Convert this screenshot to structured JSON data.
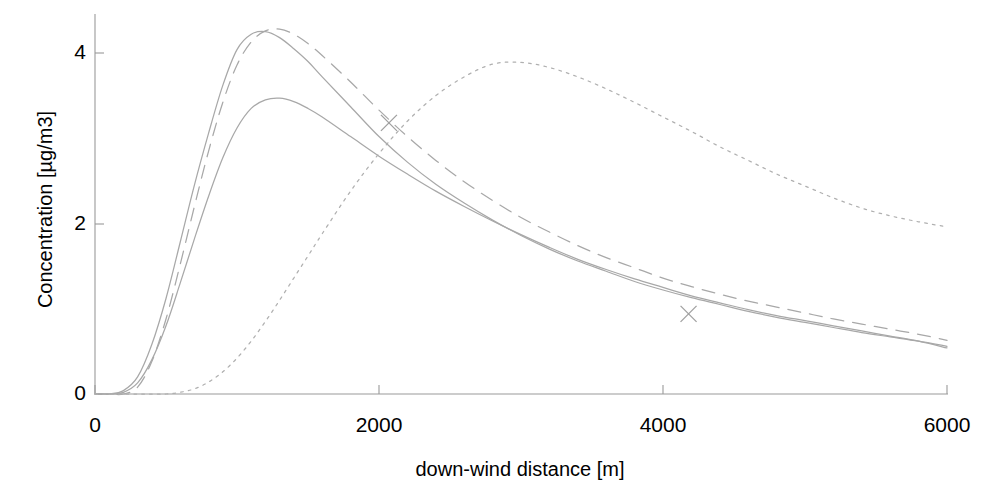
{
  "chart_data": {
    "type": "line",
    "title": "",
    "subtitle": "",
    "xlabel": "down-wind distance [m]",
    "ylabel": "Concentration [µg/m3]",
    "xlim": [
      0,
      6000
    ],
    "ylim": [
      0,
      4.6
    ],
    "xticks": [
      0,
      2000,
      4000,
      6000
    ],
    "xtick_labels": [
      "0",
      "2000",
      "4000",
      "6000"
    ],
    "yticks": [
      0,
      2,
      4
    ],
    "ytick_labels": [
      "0",
      "2",
      "4"
    ],
    "grid": false,
    "legend": "none",
    "x": [
      0,
      100,
      200,
      300,
      400,
      500,
      600,
      700,
      800,
      900,
      1000,
      1100,
      1200,
      1300,
      1400,
      1500,
      1600,
      1800,
      2000,
      2200,
      2400,
      2600,
      2800,
      3000,
      3200,
      3400,
      3600,
      3800,
      4000,
      4200,
      4400,
      4600,
      4800,
      5000,
      5200,
      5400,
      5600,
      5800,
      6000
    ],
    "series": [
      {
        "name": "solid-upper",
        "style": "solid",
        "color": "#a8a8a8",
        "peak_x": 1050,
        "peak_y": 4.27,
        "values": [
          0.0,
          0.0,
          0.04,
          0.2,
          0.58,
          1.12,
          1.78,
          2.45,
          3.06,
          3.62,
          4.04,
          4.22,
          4.25,
          4.18,
          4.05,
          3.9,
          3.72,
          3.37,
          3.02,
          2.72,
          2.46,
          2.24,
          2.04,
          1.86,
          1.7,
          1.56,
          1.44,
          1.32,
          1.22,
          1.13,
          1.05,
          0.97,
          0.9,
          0.84,
          0.78,
          0.72,
          0.67,
          0.62,
          0.56
        ]
      },
      {
        "name": "dashed",
        "style": "dashed",
        "color": "#a8a8a8",
        "peak_x": 1200,
        "peak_y": 4.28,
        "values": [
          0.0,
          0.0,
          0.0,
          0.08,
          0.38,
          0.88,
          1.52,
          2.2,
          2.85,
          3.42,
          3.86,
          4.13,
          4.26,
          4.28,
          4.22,
          4.11,
          3.97,
          3.66,
          3.33,
          3.02,
          2.74,
          2.49,
          2.27,
          2.07,
          1.9,
          1.74,
          1.6,
          1.48,
          1.36,
          1.26,
          1.17,
          1.09,
          1.02,
          0.95,
          0.88,
          0.82,
          0.76,
          0.7,
          0.63
        ]
      },
      {
        "name": "solid-lower",
        "style": "solid",
        "color": "#a8a8a8",
        "peak_x": 1250,
        "peak_y": 3.47,
        "values": [
          0.0,
          0.0,
          0.02,
          0.13,
          0.4,
          0.8,
          1.3,
          1.82,
          2.32,
          2.77,
          3.12,
          3.35,
          3.45,
          3.47,
          3.43,
          3.35,
          3.25,
          3.02,
          2.79,
          2.58,
          2.38,
          2.2,
          2.03,
          1.87,
          1.72,
          1.58,
          1.46,
          1.35,
          1.25,
          1.15,
          1.07,
          0.99,
          0.92,
          0.86,
          0.8,
          0.74,
          0.68,
          0.62,
          0.54
        ]
      },
      {
        "name": "dotted",
        "style": "dotted",
        "color": "#b0b0b0",
        "peak_x": 2850,
        "peak_y": 3.89,
        "values": [
          0.0,
          0.0,
          0.0,
          0.0,
          0.0,
          0.0,
          0.02,
          0.06,
          0.14,
          0.26,
          0.42,
          0.62,
          0.85,
          1.1,
          1.36,
          1.62,
          1.88,
          2.38,
          2.82,
          3.2,
          3.5,
          3.72,
          3.87,
          3.89,
          3.83,
          3.72,
          3.58,
          3.42,
          3.25,
          3.08,
          2.9,
          2.74,
          2.58,
          2.44,
          2.3,
          2.18,
          2.09,
          2.02,
          1.96
        ]
      }
    ],
    "markers": [
      {
        "name": "marker-1",
        "x": 2070,
        "y": 3.18,
        "symbol": "x"
      },
      {
        "name": "marker-2",
        "x": 4180,
        "y": 0.94,
        "symbol": "x"
      }
    ]
  }
}
